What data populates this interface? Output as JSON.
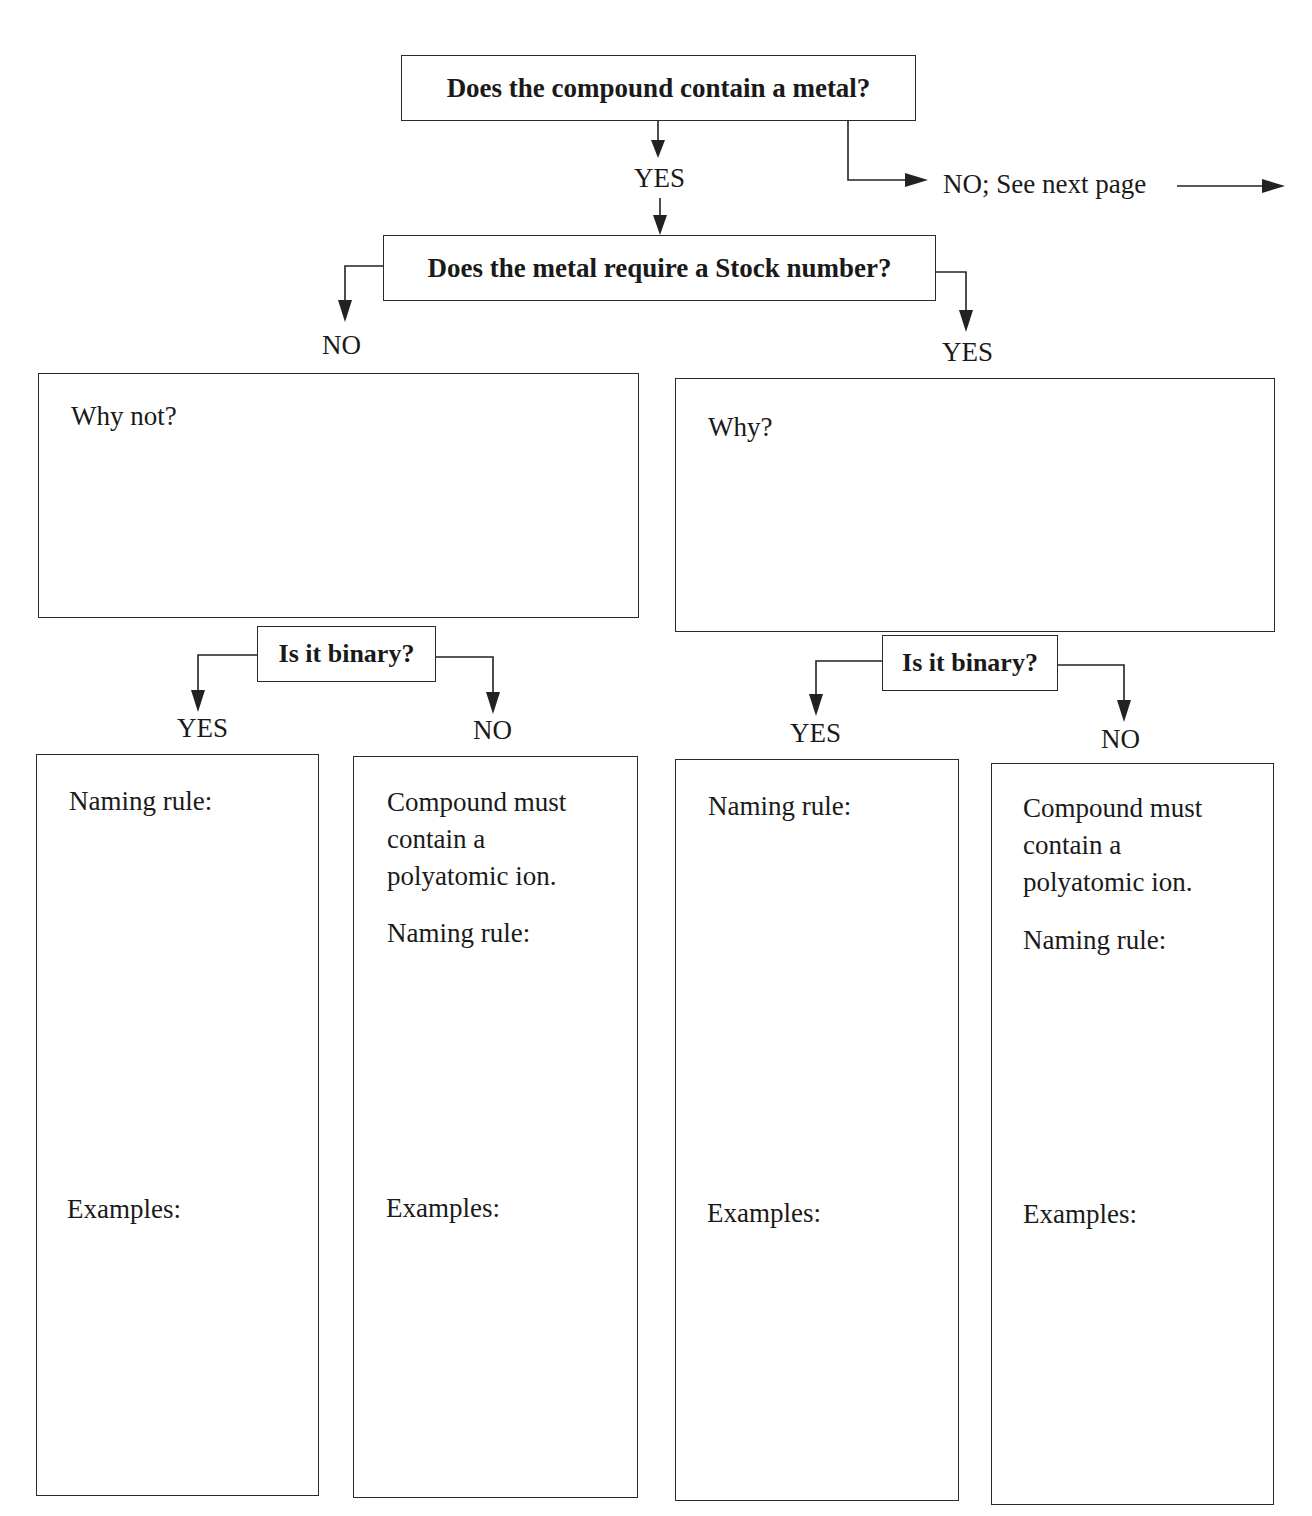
{
  "flowchart": {
    "root_question": "Does the compound contain a metal?",
    "root_yes": "YES",
    "root_no": "NO; See next page",
    "stock_question": "Does the metal require a Stock number?",
    "stock_no": "NO",
    "stock_yes": "YES",
    "why_not_box": {
      "label": "Why not?"
    },
    "why_box": {
      "label": "Why?"
    },
    "left_binary": {
      "question": "Is it binary?",
      "yes": "YES",
      "no": "NO",
      "yes_box": {
        "naming_rule": "Naming rule:",
        "examples": "Examples:"
      },
      "no_box": {
        "note": "Compound must contain a polyatomic ion.",
        "naming_rule": "Naming rule:",
        "examples": "Examples:"
      }
    },
    "right_binary": {
      "question": "Is it binary?",
      "yes": "YES",
      "no": "NO",
      "yes_box": {
        "naming_rule": "Naming rule:",
        "examples": "Examples:"
      },
      "no_box": {
        "note": "Compound must contain a polyatomic ion.",
        "naming_rule": "Naming rule:",
        "examples": "Examples:"
      }
    }
  }
}
